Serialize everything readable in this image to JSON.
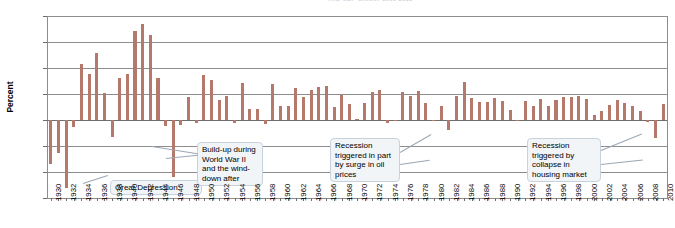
{
  "chart_data": {
    "type": "bar",
    "title": "Real GDP Growth, 1930-2010",
    "xlabel": "",
    "ylabel": "Percent",
    "ylim": [
      -15.0,
      20.0
    ],
    "ytick_step": 5.0,
    "yticks": [
      "20.0",
      "15.0",
      "10.0",
      "5.0",
      "0.0",
      "-5.0",
      "-10.0",
      "-15.0"
    ],
    "grid": true,
    "legend": "none",
    "bar_color": "#b5796b",
    "x_tick_label_step": 2,
    "xticks": [
      "1930",
      "1932",
      "1934",
      "1936",
      "1938",
      "1940",
      "1942",
      "1944",
      "1946",
      "1948",
      "1950",
      "1952",
      "1954",
      "1956",
      "1958",
      "1960",
      "1962",
      "1964",
      "1966",
      "1968",
      "1970",
      "1972",
      "1974",
      "1976",
      "1978",
      "1980",
      "1982",
      "1984",
      "1986",
      "1988",
      "1990",
      "1992",
      "1994",
      "1996",
      "1998",
      "2000",
      "2002",
      "2004",
      "2006",
      "2008",
      "2010"
    ],
    "categories": [
      1930,
      1931,
      1932,
      1933,
      1934,
      1935,
      1936,
      1937,
      1938,
      1939,
      1940,
      1941,
      1942,
      1943,
      1944,
      1945,
      1946,
      1947,
      1948,
      1949,
      1950,
      1951,
      1952,
      1953,
      1954,
      1955,
      1956,
      1957,
      1958,
      1959,
      1960,
      1961,
      1962,
      1963,
      1964,
      1965,
      1966,
      1967,
      1968,
      1969,
      1970,
      1971,
      1972,
      1973,
      1974,
      1975,
      1976,
      1977,
      1978,
      1979,
      1980,
      1981,
      1982,
      1983,
      1984,
      1985,
      1986,
      1987,
      1988,
      1989,
      1990,
      1991,
      1992,
      1993,
      1994,
      1995,
      1996,
      1997,
      1998,
      1999,
      2000,
      2001,
      2002,
      2003,
      2004,
      2005,
      2006,
      2007,
      2008,
      2009,
      2010
    ],
    "values": [
      -8.5,
      -6.4,
      -13.0,
      -1.3,
      10.8,
      8.9,
      12.9,
      5.1,
      -3.3,
      8.0,
      8.8,
      17.1,
      18.5,
      16.4,
      8.1,
      -1.1,
      -10.9,
      -0.9,
      4.4,
      -0.5,
      8.7,
      7.7,
      3.8,
      4.6,
      -0.6,
      7.1,
      2.1,
      2.1,
      -0.7,
      6.9,
      2.6,
      2.6,
      6.1,
      4.4,
      5.8,
      6.4,
      6.5,
      2.5,
      4.8,
      3.1,
      0.2,
      3.3,
      5.3,
      5.8,
      -0.5,
      -0.2,
      5.4,
      4.6,
      5.6,
      3.2,
      -0.2,
      2.6,
      -1.9,
      4.6,
      7.3,
      4.2,
      3.5,
      3.5,
      4.2,
      3.7,
      1.9,
      -0.1,
      3.6,
      2.7,
      4.0,
      2.7,
      3.8,
      4.5,
      4.5,
      4.7,
      4.1,
      1.0,
      1.8,
      2.8,
      3.8,
      3.3,
      2.7,
      1.8,
      -0.3,
      -3.5,
      3.0
    ]
  },
  "annotations": [
    {
      "id": "great-depression",
      "text": "Great Depression"
    },
    {
      "id": "world-war-two",
      "text": "Build-up during World War II and the wind-down after"
    },
    {
      "id": "oil-price-recession",
      "text": "Recession triggered in part by surge in oil prices"
    },
    {
      "id": "housing-recession",
      "text": "Recession triggered by collapse in housing market"
    }
  ]
}
